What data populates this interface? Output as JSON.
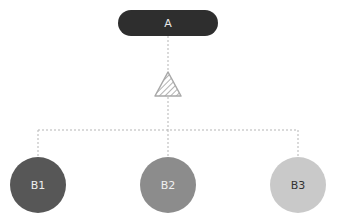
{
  "diagram": {
    "root": {
      "label": "A",
      "color": "#2e2e2e",
      "text_color": "#e8e8e8"
    },
    "connector": {
      "shape": "triangle",
      "fill": "hatched"
    },
    "children": [
      {
        "label": "B1",
        "color": "#575757",
        "text_color": "#eeeeee"
      },
      {
        "label": "B2",
        "color": "#8c8c8c",
        "text_color": "#f0f0f0"
      },
      {
        "label": "B3",
        "color": "#c9c9c9",
        "text_color": "#333333"
      }
    ]
  }
}
